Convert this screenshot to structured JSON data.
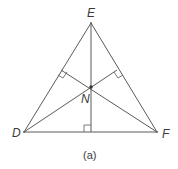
{
  "diagram": {
    "caption": "(a)",
    "vertices": {
      "E": {
        "label": "E",
        "x": 91,
        "y": 23
      },
      "D": {
        "label": "D",
        "x": 24,
        "y": 132
      },
      "F": {
        "label": "F",
        "x": 157,
        "y": 132
      }
    },
    "center": {
      "label": "N",
      "x": 91,
      "y": 87
    },
    "colors": {
      "line": "#5a5a5a",
      "text": "#3a3a3a"
    }
  }
}
